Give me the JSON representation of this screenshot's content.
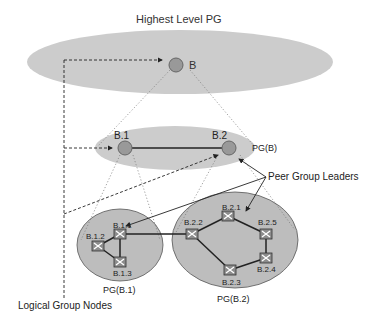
{
  "title": "Highest Level PG",
  "colors": {
    "ellipse_fill": "#cfcfcf",
    "ellipse_fill_dark": "#b9b9b9",
    "node_fill": "#9a9a9a",
    "node_stroke": "#6e6e6e",
    "line": "#222222",
    "switch_fill": "#8c8c8c"
  },
  "levels": {
    "top": {
      "label": "Highest Level PG",
      "node": "B"
    },
    "middle": {
      "label": "PG(B)",
      "nodes": [
        "B.1",
        "B.2"
      ]
    },
    "bottom": [
      {
        "label": "PG(B.1)",
        "nodes": [
          "B.1.1",
          "B.1.2",
          "B.1.3"
        ]
      },
      {
        "label": "PG(B.2)",
        "nodes": [
          "B.2.1",
          "B.2.2",
          "B.2.3",
          "B.2.4",
          "B.2.5"
        ]
      }
    ]
  },
  "annotations": {
    "peer_group_leaders": "Peer Group Leaders",
    "logical_group_nodes": "Logical Group Nodes"
  },
  "links": [
    [
      "B.1",
      "B.2"
    ],
    [
      "B.1.1",
      "B.1.2"
    ],
    [
      "B.1.1",
      "B.1.3"
    ],
    [
      "B.1.2",
      "B.1.3"
    ],
    [
      "B.1.1",
      "B.2.2"
    ],
    [
      "B.2.2",
      "B.2.1"
    ],
    [
      "B.2.1",
      "B.2.5"
    ],
    [
      "B.2.5",
      "B.2.4"
    ],
    [
      "B.2.4",
      "B.2.3"
    ],
    [
      "B.2.3",
      "B.2.2"
    ]
  ]
}
